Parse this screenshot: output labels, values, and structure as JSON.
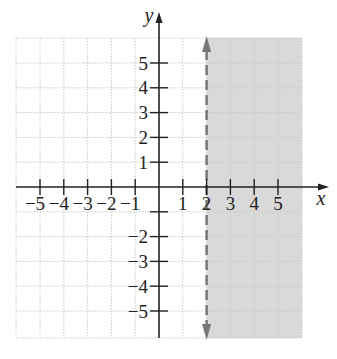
{
  "chart_data": {
    "type": "inequality-graph",
    "title": "",
    "xlabel": "x",
    "ylabel": "y",
    "xlim": [
      -6,
      6
    ],
    "ylim": [
      -6,
      6
    ],
    "grid": true,
    "x_ticks": [
      -5,
      -4,
      -3,
      -2,
      -1,
      1,
      2,
      3,
      4,
      5
    ],
    "x_tick_labels": [
      "−5",
      "−4",
      "−3",
      "−2",
      "−1",
      "1",
      "2",
      "3",
      "4",
      "5"
    ],
    "y_ticks": [
      5,
      4,
      3,
      2,
      1,
      -2,
      -3,
      -4,
      -5
    ],
    "y_tick_labels": [
      "5",
      "4",
      "3",
      "2",
      "1",
      "−2",
      "−3",
      "−4",
      "−5"
    ],
    "boundary": {
      "type": "vertical-line",
      "x": 2,
      "style": "dashed",
      "arrows": "both"
    },
    "shaded_region": {
      "description": "x > 2",
      "x_from": 2,
      "x_to": 5.8
    },
    "inequality": "x > 2",
    "colors": {
      "shade": "#d9d9d9",
      "boundary": "#777777",
      "axis": "#222222",
      "grid": "#c8c8c8"
    }
  }
}
